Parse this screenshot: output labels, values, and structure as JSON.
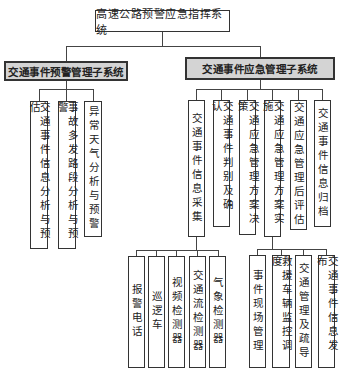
{
  "root": {
    "label": "高速公路预警应急指挥系统"
  },
  "subsystems": [
    {
      "label": "交通事件预警管理子系统",
      "children": [
        {
          "label": "交通事件信息分析与预估"
        },
        {
          "label": "事故多发路段分析与预警"
        },
        {
          "label": "异常天气分析与预警"
        }
      ]
    },
    {
      "label": "交通事件应急管理子系统",
      "children": [
        {
          "label": "交通事件信息采集",
          "children": [
            {
              "label": "报警电话"
            },
            {
              "label": "巡逻车"
            },
            {
              "label": "视频检测器"
            },
            {
              "label": "交通流检测器"
            },
            {
              "label": "气象检测器"
            }
          ]
        },
        {
          "label": "交通事件判别及确认"
        },
        {
          "label": "交通应急管理方案决策"
        },
        {
          "label": "交通应急管理方案实施",
          "children": [
            {
              "label": "事件现场管理"
            },
            {
              "label": "救援车辆监控调度"
            },
            {
              "label": "交通管理及疏导"
            },
            {
              "label": "交通事件信息发布"
            }
          ]
        },
        {
          "label": "交通应急管理后评估"
        },
        {
          "label": "交通事件信息归档"
        }
      ]
    }
  ]
}
